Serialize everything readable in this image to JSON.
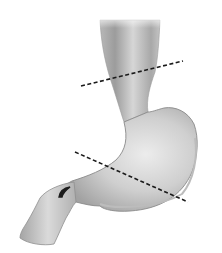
{
  "figure": {
    "background": "#ffffff",
    "organ_fill_light": "#e8e8e8",
    "organ_fill_dark": "#a9a9a9",
    "outline_color": "#8a8a8a",
    "cut_line_color": "#1a1a1a",
    "cut_lines": [
      {
        "name": "upper-cut-line",
        "x1": 81,
        "y1": 86,
        "x2": 183,
        "y2": 61
      },
      {
        "name": "lower-cut-line",
        "x1": 75,
        "y1": 152,
        "x2": 188,
        "y2": 202
      }
    ]
  }
}
